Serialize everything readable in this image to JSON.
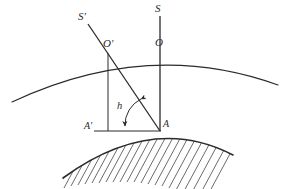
{
  "figure": {
    "type": "geometry-diagram",
    "background_color": "#ffffff",
    "line_color": "#2b2b2b",
    "labels": [
      {
        "id": "S-prime",
        "text": "S'",
        "x": 78,
        "y": 11,
        "style": "italic"
      },
      {
        "id": "S",
        "text": "S",
        "x": 155,
        "y": 3,
        "style": "italic"
      },
      {
        "id": "O-prime",
        "text": "O'",
        "x": 103,
        "y": 38,
        "style": "italic"
      },
      {
        "id": "O",
        "text": "O",
        "x": 155,
        "y": 37,
        "style": "italic"
      },
      {
        "id": "h",
        "text": "h",
        "x": 117,
        "y": 101,
        "style": "italic"
      },
      {
        "id": "A-prime",
        "text": "A'",
        "x": 84,
        "y": 121,
        "style": "italic"
      },
      {
        "id": "A",
        "text": "A",
        "x": 163,
        "y": 119,
        "style": "italic"
      }
    ],
    "points": {
      "A": {
        "x": 160,
        "y": 131
      },
      "A_prime": {
        "x": 108,
        "y": 131
      },
      "O": {
        "x": 160,
        "y": 50
      },
      "O_prime": {
        "x": 108,
        "y": 53
      },
      "S_top": {
        "x": 160,
        "y": 16
      },
      "S_prime_top": {
        "x": 88,
        "y": 24
      }
    },
    "arcs": {
      "atmosphere": {
        "start": [
          12,
          102
        ],
        "apex": [
          160,
          50
        ],
        "end": [
          278,
          85
        ]
      },
      "earth_surface": {
        "start": [
          63,
          178
        ],
        "apex": [
          155,
          132
        ],
        "end": [
          233,
          155
        ]
      }
    },
    "angle_arc": {
      "label": "h",
      "vertex": [
        160,
        131
      ],
      "double_headed": true
    },
    "hatching": {
      "region": "earth-interior",
      "line_count": 26
    }
  }
}
